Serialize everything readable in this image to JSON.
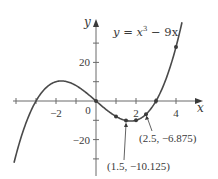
{
  "chart_data": {
    "type": "line",
    "title": "",
    "equation_label": "y = x³ − 9x",
    "equation": {
      "prefix": "y = x",
      "exponent": "3",
      "suffix": " − 9x"
    },
    "xlabel": "x",
    "ylabel": "y",
    "xlim": [
      -4.2,
      5.2
    ],
    "ylim": [
      -40,
      42
    ],
    "grid": false,
    "x_ticks": [
      -4,
      -3,
      -2,
      -1,
      1,
      2,
      3,
      4
    ],
    "x_tick_labels": [
      {
        "value": -2,
        "text": "−2"
      },
      {
        "value": 0,
        "text": "0"
      },
      {
        "value": 2,
        "text": "2"
      },
      {
        "value": 4,
        "text": "4"
      }
    ],
    "y_ticks": [
      -30,
      -20,
      -10,
      10,
      20,
      30
    ],
    "y_tick_labels": [
      {
        "value": 20,
        "text": "20"
      },
      {
        "value": -20,
        "text": "−20"
      }
    ],
    "series": [
      {
        "name": "y = x^3 - 9x",
        "function": "x^3 - 9x",
        "x_range": [
          -4.1,
          4.3
        ],
        "color": "#4a4a4a"
      }
    ],
    "points": [
      {
        "x": 0,
        "y": 0
      },
      {
        "x": 1,
        "y": -8
      },
      {
        "x": 1.5,
        "y": -10.125
      },
      {
        "x": 2,
        "y": -10
      },
      {
        "x": 2.5,
        "y": -6.875
      },
      {
        "x": 3,
        "y": 0
      },
      {
        "x": 4,
        "y": 28
      }
    ],
    "annotations": [
      {
        "text": "(1.5, −10.125)",
        "point": {
          "x": 1.5,
          "y": -10.125
        }
      },
      {
        "text": "(2.5, −6.875)",
        "point": {
          "x": 2.5,
          "y": -6.875
        }
      }
    ]
  },
  "colors": {
    "curve": "#4a4a4a",
    "axis": "#6a6a6a",
    "text": "#3a3a3a",
    "point": "#3a3a3a"
  }
}
